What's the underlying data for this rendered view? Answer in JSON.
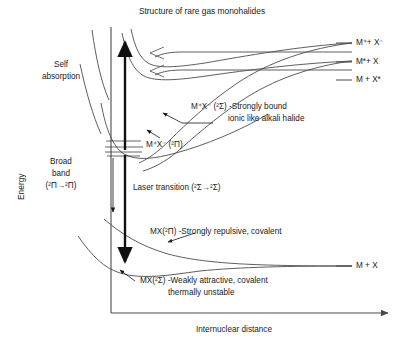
{
  "figure": {
    "title": "Structure of rare gas monohalides",
    "axes": {
      "y_label": "Energy",
      "x_label": "Internuclear distance"
    },
    "asymptote_labels": [
      {
        "id": "ionic",
        "text": "M⁺+ X⁻"
      },
      {
        "id": "m-excited",
        "text": "M*+ X"
      },
      {
        "id": "x-excited",
        "text": "M + X*"
      },
      {
        "id": "ground",
        "text": "M + X"
      }
    ],
    "state_annotations": [
      {
        "id": "ionic-sigma",
        "line1": "M⁺X⁻ (²Σ) -Strongly bound",
        "line2": "ionic like alkali halide"
      },
      {
        "id": "ionic-pi",
        "line1": "M⁺X⁻ (²Π)"
      },
      {
        "id": "covalent-pi",
        "line1": "MX(²Π) -Strongly repulsive, covalent"
      },
      {
        "id": "covalent-sigma",
        "line1": "MX(²Σ) -Weakly attractive, covalent",
        "line2": "thermally unstable"
      }
    ],
    "transitions": [
      {
        "id": "self-absorption",
        "line1": "Self",
        "line2": "absorption",
        "direction": "up"
      },
      {
        "id": "broad-band",
        "line1": "Broad",
        "line2": "band",
        "line3": "(²Π→²Π)",
        "direction": "down"
      },
      {
        "id": "laser-transition",
        "line1": "Laser transition (²Σ→²Σ)",
        "direction": "down"
      }
    ],
    "colors": {
      "ink": "#1a1a1a",
      "curve": "#555555",
      "axis": "#4a4a4a",
      "background": "#ffffff"
    }
  }
}
